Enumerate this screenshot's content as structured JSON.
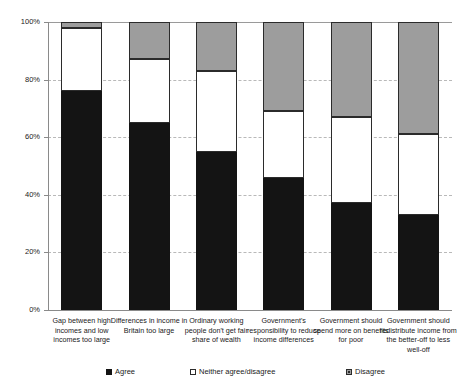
{
  "chart_data": {
    "type": "bar",
    "subtype": "stacked-bar-100-percent",
    "title": "",
    "xlabel": "",
    "ylabel": "",
    "ylim": [
      0,
      100
    ],
    "ytick_labels": [
      "0%",
      "20%",
      "40%",
      "60%",
      "80%",
      "100%"
    ],
    "ytick_values": [
      0,
      20,
      40,
      60,
      80,
      100
    ],
    "grid": true,
    "legend_position": "bottom",
    "categories": [
      "Gap between high incomes and low incomes too large",
      "Differences in income in Britain  too large",
      "Ordinary working people don't get fair share of wealth",
      "Government's responsibility to reduce income differences",
      "Government should spend more on benefits for poor",
      "Government should redistribute income from the better-off to less well-off"
    ],
    "series": [
      {
        "name": "Agree",
        "color": "#141414",
        "values": [
          76,
          65,
          55,
          46,
          37,
          33
        ]
      },
      {
        "name": "Neither agree/disagree",
        "color": "#ffffff",
        "values": [
          22,
          22,
          28,
          23,
          30,
          28
        ]
      },
      {
        "name": "Disagree",
        "color": "#9d9d9d",
        "values": [
          2,
          13,
          17,
          31,
          33,
          39
        ]
      }
    ]
  },
  "axis": {
    "y_ticks": [
      {
        "label": "0%",
        "value": 0
      },
      {
        "label": "20%",
        "value": 20
      },
      {
        "label": "40%",
        "value": 40
      },
      {
        "label": "60%",
        "value": 60
      },
      {
        "label": "80%",
        "value": 80
      },
      {
        "label": "100%",
        "value": 100
      }
    ]
  },
  "legend": {
    "items": [
      {
        "label": "Agree",
        "swatch": "agree-swatch"
      },
      {
        "label": "Neither agree/disagree",
        "swatch": "neither-swatch"
      },
      {
        "label": "Disagree",
        "swatch": "disagree-swatch"
      }
    ]
  }
}
